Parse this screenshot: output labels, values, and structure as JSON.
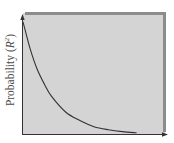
{
  "chart_data": {
    "type": "line",
    "title": "",
    "xlabel": "",
    "ylabel": "Probability (R²)",
    "ylabel_parts": {
      "prefix": "Probability (",
      "var": "R",
      "sup": "2",
      "suffix": ")"
    },
    "grid": false,
    "legend": null,
    "x_ticks": [],
    "y_ticks": [],
    "xlim": [
      0,
      1
    ],
    "ylim": [
      0,
      1
    ],
    "series": [
      {
        "name": "exponential decay",
        "shape": "monotonically decreasing convex curve approaching zero",
        "x": [
          0.0,
          0.05,
          0.1,
          0.15,
          0.2,
          0.3,
          0.4,
          0.5,
          0.6,
          0.7,
          0.8
        ],
        "y": [
          0.92,
          0.7,
          0.53,
          0.41,
          0.31,
          0.18,
          0.11,
          0.06,
          0.035,
          0.02,
          0.01
        ]
      }
    ],
    "colors": {
      "panel": "#d4d4d4",
      "panel_border": "#8c8c8c",
      "curve": "#333333",
      "axis": "#333333"
    }
  }
}
